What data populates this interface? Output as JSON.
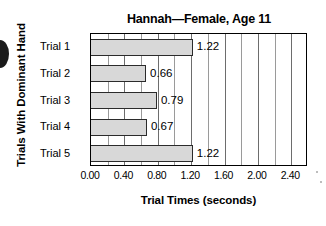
{
  "chart_data": {
    "type": "bar",
    "orientation": "horizontal",
    "title": "Hannah—Female, Age 11",
    "xlabel": "Trial Times (seconds)",
    "ylabel": "Trials With Dominant Hand",
    "categories": [
      "Trial 1",
      "Trial 2",
      "Trial 3",
      "Trial 4",
      "Trial 5"
    ],
    "values": [
      1.22,
      0.66,
      0.79,
      0.67,
      1.22
    ],
    "value_labels": [
      "1.22",
      "0.66",
      "0.79",
      "0.67",
      "1.22"
    ],
    "xlim": [
      0.0,
      2.6
    ],
    "xticks": [
      0.0,
      0.4,
      0.8,
      1.2,
      1.6,
      2.0,
      2.4
    ],
    "xtick_labels": [
      "0.00",
      "0.40",
      "0.80",
      "1.20",
      "1.60",
      "2.00",
      "2.40"
    ],
    "minor_gridline_step": 0.2,
    "grid": true,
    "legend": null,
    "bar_fill_color": "#d8d8d8",
    "bar_edge_color": "#2b2b2b",
    "gridline_color": "#6d6d6d",
    "axis_color": "#000000",
    "background_color": "#ffffff"
  }
}
